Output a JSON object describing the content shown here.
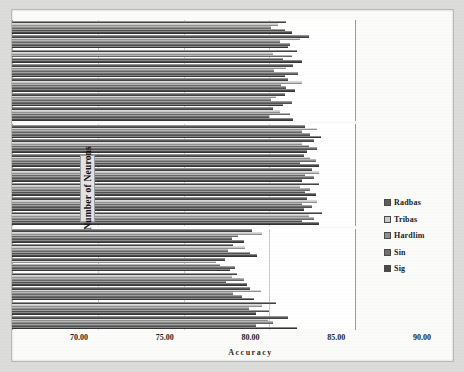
{
  "chart_data": {
    "type": "bar",
    "orientation": "horizontal",
    "title": "",
    "xlabel": "Accuracy",
    "ylabel": "Number of Neurons",
    "xlim": [
      70.0,
      90.0
    ],
    "xticks": [
      "70.00",
      "75.00",
      "80.00",
      "85.00",
      "90.00"
    ],
    "xtick_values": [
      70,
      75,
      80,
      85,
      90
    ],
    "grid": true,
    "legend_position": "right",
    "categories": [
      "50",
      "100",
      "150",
      "200",
      "250",
      "300",
      "350"
    ],
    "series_names": [
      "Radbas",
      "Tribas",
      "Hardlim",
      "Sin",
      "Sig"
    ],
    "series_colors": [
      "#5d5d5d",
      "#c9c9c9",
      "#8f8f8f",
      "#6f6f6f",
      "#4a4a4a"
    ],
    "panels": [
      {
        "name": "ELM-II",
        "series": [
          {
            "name": "Radbas",
            "values": [
              85.2,
              85.9,
              86.1,
              86.4,
              86.6,
              87.3,
              86.0
            ]
          },
          {
            "name": "Tribas",
            "values": [
              85.6,
              85.4,
              86.9,
              86.0,
              85.2,
              86.8,
              85.5
            ]
          },
          {
            "name": "Hardlim",
            "values": [
              86.2,
              85.1,
              85.7,
              85.3,
              86.3,
              85.6,
              85.1
            ]
          },
          {
            "name": "Sin",
            "values": [
              85.0,
              86.3,
              86.0,
              86.7,
              85.8,
              86.2,
              85.9
            ]
          },
          {
            "name": "Sig",
            "values": [
              86.4,
              85.8,
              86.5,
              85.9,
              86.9,
              86.1,
              86.3
            ]
          }
        ]
      },
      {
        "name": "ELM-I",
        "series": [
          {
            "name": "Radbas",
            "values": [
              88.1,
              87.2,
              87.9,
              87.5,
              87.0,
              87.6,
              87.1
            ]
          },
          {
            "name": "Tribas",
            "values": [
              87.3,
              87.8,
              86.8,
              87.9,
              87.4,
              86.9,
              87.8
            ]
          },
          {
            "name": "Hardlim",
            "values": [
              87.6,
              86.9,
              87.4,
              87.1,
              87.7,
              87.3,
              86.9
            ]
          },
          {
            "name": "Sin",
            "values": [
              86.9,
              87.5,
              87.1,
              87.6,
              86.8,
              87.8,
              87.4
            ]
          },
          {
            "name": "Sig",
            "values": [
              87.9,
              87.0,
              87.7,
              86.9,
              87.9,
              87.2,
              88.0
            ]
          }
        ]
      },
      {
        "name": "ELM",
        "series": [
          {
            "name": "Radbas",
            "values": [
              86.1,
              85.4,
              83.9,
              83.1,
              82.4,
              82.9,
              84.0
            ]
          },
          {
            "name": "Tribas",
            "values": [
              84.9,
              84.6,
              84.5,
              82.8,
              81.9,
              83.6,
              84.6
            ]
          },
          {
            "name": "Hardlim",
            "values": [
              85.2,
              83.8,
              82.9,
              83.5,
              82.1,
              82.6,
              83.2
            ]
          },
          {
            "name": "Sin",
            "values": [
              84.2,
              85.0,
              83.4,
              82.5,
              83.0,
              83.9,
              82.8
            ]
          },
          {
            "name": "Sig",
            "values": [
              86.6,
              84.2,
              84.1,
              83.7,
              82.7,
              84.3,
              83.5
            ]
          }
        ]
      }
    ]
  },
  "axis": {
    "value_title": "Accuracy",
    "category_title": "Number of Neurons"
  },
  "legend": {
    "items": [
      {
        "label": "Radbas",
        "color": "#5d5d5d"
      },
      {
        "label": "Tribas",
        "color": "#c9c9c9"
      },
      {
        "label": "Hardlim",
        "color": "#8f8f8f"
      },
      {
        "label": "Sin",
        "color": "#6f6f6f"
      },
      {
        "label": "Sig",
        "color": "#4a4a4a"
      }
    ]
  }
}
